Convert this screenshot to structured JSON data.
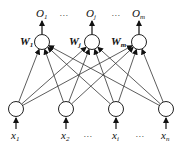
{
  "diagram": {
    "type": "neural-network",
    "output_layer": {
      "nodes": [
        {
          "label": "O",
          "sub": "1",
          "weight_label": "W",
          "weight_sub": "1",
          "x": 42,
          "y": 42
        },
        {
          "label": "O",
          "sub": "j",
          "weight_label": "W",
          "weight_sub": "j",
          "x": 92,
          "y": 42
        },
        {
          "label": "O",
          "sub": "m",
          "weight_label": "W",
          "weight_sub": "m",
          "x": 139,
          "y": 42
        }
      ],
      "ellipsis": "…"
    },
    "input_layer": {
      "nodes": [
        {
          "label": "x",
          "sub": "1",
          "x": 16,
          "y": 109
        },
        {
          "label": "x",
          "sub": "2",
          "x": 66,
          "y": 109
        },
        {
          "label": "x",
          "sub": "i",
          "x": 116,
          "y": 109
        },
        {
          "label": "x",
          "sub": "n",
          "x": 166,
          "y": 109
        }
      ],
      "ellipsis": "…"
    },
    "connections": "fully-connected",
    "colors": {
      "stroke": "#222222",
      "node_fill": "#ffffff"
    }
  }
}
